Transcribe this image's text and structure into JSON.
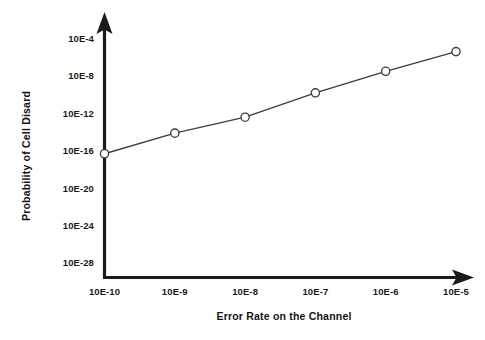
{
  "chart_data": {
    "type": "line",
    "title": "",
    "subtitle": "",
    "xlabel": "Error Rate on the Channel",
    "ylabel": "Probability of Cell Disard",
    "grid": false,
    "legend": null,
    "legend_position": "none",
    "marker": "open-circle",
    "line_color": "#3c3c46",
    "marker_fill": "#ffffff",
    "axis_color": "#1a1a1a",
    "background": "#ffffff",
    "x_scale": "log",
    "y_scale": "log",
    "x_tick_labels": [
      "10E-10",
      "10E-9",
      "10E-8",
      "10E-7",
      "10E-6",
      "10E-5"
    ],
    "x_tick_exponents": [
      -10,
      -9,
      -8,
      -7,
      -6,
      -5
    ],
    "y_tick_labels": [
      "10E-4",
      "10E-8",
      "10E-12",
      "10E-16",
      "10E-20",
      "10E-24",
      "10E-28"
    ],
    "y_tick_exponents": [
      -4,
      -8,
      -12,
      -16,
      -20,
      -24,
      -28
    ],
    "xlim_exponents": [
      -10.3,
      -4.6
    ],
    "ylim_exponents": [
      -29.2,
      -2.6
    ],
    "x": [
      1e-10,
      1e-09,
      1e-08,
      1e-07,
      1e-06,
      1e-05
    ],
    "x_exponents": [
      -10,
      -9,
      -8,
      -7,
      -6,
      -5
    ],
    "values": [
      4e-17,
      6e-15,
      3e-13,
      1.3e-10,
      2.5e-08,
      3e-06
    ],
    "value_exponents": [
      -16.4,
      -14.2,
      -12.5,
      -9.9,
      -7.6,
      -5.5
    ],
    "points": [
      {
        "x_label": "10E-10",
        "y_exponent": -16.4
      },
      {
        "x_label": "10E-9",
        "y_exponent": -14.2
      },
      {
        "x_label": "10E-8",
        "y_exponent": -12.5
      },
      {
        "x_label": "10E-7",
        "y_exponent": -9.9
      },
      {
        "x_label": "10E-6",
        "y_exponent": -7.6
      },
      {
        "x_label": "10E-5",
        "y_exponent": -5.5
      }
    ],
    "annotations": []
  }
}
